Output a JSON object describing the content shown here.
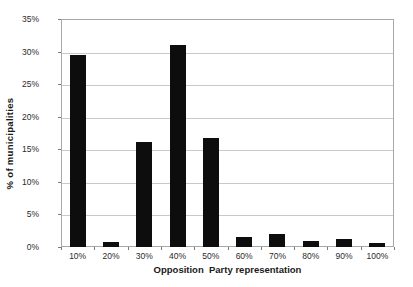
{
  "chart_data": {
    "type": "bar",
    "title": "",
    "xlabel": "Opposition  Party representation",
    "ylabel": "% of municipalities",
    "categories": [
      "10%",
      "20%",
      "30%",
      "40%",
      "50%",
      "60%",
      "70%",
      "80%",
      "90%",
      "100%"
    ],
    "values": [
      29.4,
      0.7,
      16.1,
      31.0,
      16.8,
      1.6,
      2.0,
      1.0,
      1.2,
      0.6
    ],
    "ylim": [
      0,
      35
    ],
    "ytick_labels": [
      "0%",
      "5%",
      "10%",
      "15%",
      "20%",
      "25%",
      "30%",
      "35%"
    ],
    "ytick_values": [
      0,
      5,
      10,
      15,
      20,
      25,
      30,
      35
    ],
    "grid": true,
    "legend": false,
    "legend_position": "none",
    "bar_color": "#0d0d0d",
    "grid_color": "#c9c9c9",
    "axis_color": "#a8a8a8",
    "background_color": "#ffffff"
  }
}
